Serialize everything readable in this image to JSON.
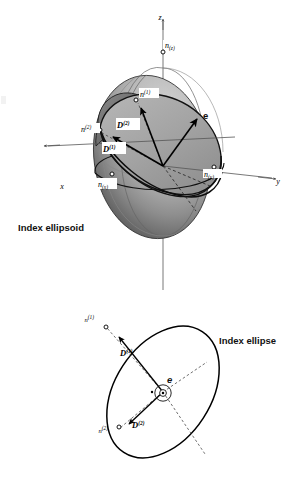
{
  "figure": {
    "title_upper": "Index ellipsoid",
    "title_lower": "Index ellipse"
  },
  "upper_diagram": {
    "name": "index-ellipsoid",
    "caption": "Index ellipsoid",
    "axes": [
      {
        "id": "z",
        "label": "z",
        "direction": "up"
      },
      {
        "id": "y",
        "label": "y",
        "direction": "right"
      },
      {
        "id": "x",
        "label": "x",
        "direction": "lower-left"
      }
    ],
    "principal_indices": [
      {
        "id": "nz",
        "base": "n",
        "sub": "(z)",
        "axis": "z"
      },
      {
        "id": "ny",
        "base": "n",
        "sub": "(y)",
        "axis": "y"
      },
      {
        "id": "nx",
        "base": "n",
        "sub": "(x)",
        "axis": "x"
      }
    ],
    "section_axes": [
      {
        "id": "n1",
        "base": "n",
        "sup": "(1)"
      },
      {
        "id": "n2",
        "base": "n",
        "sup": "(2)"
      }
    ],
    "vectors": [
      {
        "id": "D1",
        "base": "D",
        "sup": "(1)",
        "style": "bold-italic"
      },
      {
        "id": "D2",
        "base": "D",
        "sup": "(2)",
        "style": "bold-italic"
      },
      {
        "id": "e",
        "base": "e",
        "sup": "",
        "style": "bold"
      }
    ]
  },
  "lower_diagram": {
    "name": "index-ellipse",
    "caption": "Index ellipse",
    "section_axes": [
      {
        "id": "n1",
        "base": "n",
        "sup": "(1)"
      },
      {
        "id": "n2",
        "base": "n",
        "sup": "(2)"
      }
    ],
    "vectors": [
      {
        "id": "D1",
        "base": "D",
        "sup": "(1)",
        "style": "bold-italic"
      },
      {
        "id": "D2",
        "base": "D",
        "sup": "(2)",
        "style": "bold-italic"
      },
      {
        "id": "e",
        "base": "e",
        "sup": "",
        "style": "bold",
        "marker": "out-of-page-dot"
      }
    ]
  },
  "colors": {
    "ink": "#111111",
    "ellipsoid_light": "#c9c9c9",
    "ellipsoid_dark": "#4a4a4a",
    "section_fill": "#a8a8a8",
    "section_fill_dark": "#6f6f6f",
    "background": "#ffffff"
  }
}
